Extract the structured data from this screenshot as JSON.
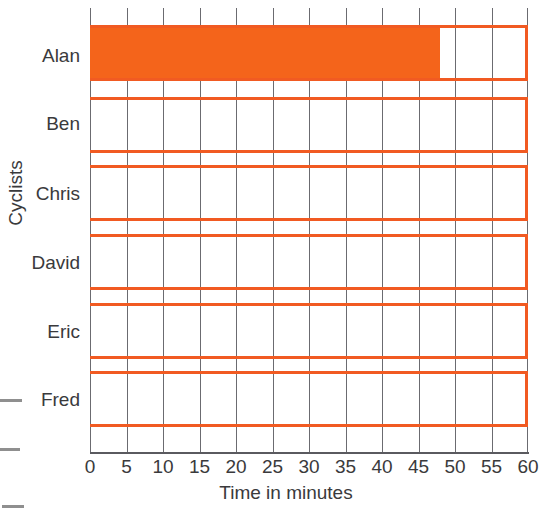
{
  "chart_data": {
    "type": "bar",
    "orientation": "horizontal",
    "title": "",
    "xlabel": "Time in minutes",
    "ylabel": "Cyclists",
    "categories": [
      "Alan",
      "Ben",
      "Chris",
      "David",
      "Eric",
      "Fred"
    ],
    "values": [
      48,
      0,
      0,
      0,
      0,
      0
    ],
    "xlim": [
      0,
      60
    ],
    "xticks": [
      0,
      5,
      10,
      15,
      20,
      25,
      30,
      35,
      40,
      45,
      50,
      55,
      60
    ],
    "xtick_labels": [
      "0",
      "5",
      "10",
      "15",
      "20",
      "25",
      "30",
      "35",
      "40",
      "45",
      "50",
      "55",
      "60"
    ],
    "grid": true,
    "grid_axis": "x",
    "legend": false,
    "bar_color": "#F4641B",
    "bar_outline_color": "#F15A22",
    "gridline_color": "#6B6B70",
    "text_color": "#3A3A3C",
    "note": "Blank worksheet bar chart: only Alan's bar is filled, to approximately 48 minutes; the other five cyclists have empty bar outlines."
  },
  "axes": {
    "x_title": "Time in minutes",
    "y_title": "Cyclists"
  }
}
